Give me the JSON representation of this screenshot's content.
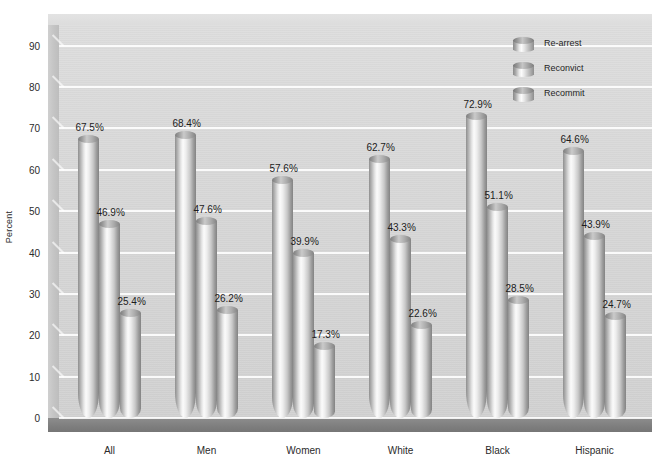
{
  "chart_data": {
    "type": "bar",
    "title": "",
    "subtitle": "",
    "xlabel": "",
    "ylabel": "Percent",
    "ylim": [
      0,
      95
    ],
    "ytick_values": [
      0,
      10,
      20,
      30,
      40,
      50,
      60,
      70,
      80,
      90
    ],
    "ytick_labels": [
      "0",
      "10",
      "20",
      "30",
      "40",
      "50",
      "60",
      "70",
      "80",
      "90"
    ],
    "grid": true,
    "grid_axis": "y",
    "legend_position": "top-right",
    "categories": [
      "All",
      "Men",
      "Women",
      "White",
      "Black",
      "Hispanic"
    ],
    "series": [
      {
        "name": "Re-arrest",
        "values": [
          67.5,
          68.4,
          57.6,
          62.7,
          72.9,
          64.6
        ],
        "labels": [
          "67.5%",
          "68.4%",
          "57.6%",
          "62.7%",
          "72.9%",
          "64.6%"
        ]
      },
      {
        "name": "Reconvict",
        "values": [
          46.9,
          47.6,
          39.9,
          43.3,
          51.1,
          43.9
        ],
        "labels": [
          "46.9%",
          "47.6%",
          "39.9%",
          "43.3%",
          "51.1%",
          "43.9%"
        ]
      },
      {
        "name": "Recommit",
        "values": [
          25.4,
          26.2,
          17.3,
          22.6,
          28.5,
          24.7
        ],
        "labels": [
          "25.4%",
          "26.2%",
          "17.3%",
          "22.6%",
          "28.5%",
          "24.7%"
        ]
      }
    ],
    "style": {
      "render": "3d-cylinder",
      "plot_background": "#d8d8d8",
      "floor_color": "#808080",
      "gridline_color": "#ffffff",
      "page_background": "#ffffff",
      "bar_highlight": "#fbfbfb",
      "bar_shadow": "#838383",
      "text_color": "#1f1f1f"
    }
  },
  "legend": {
    "items": [
      {
        "label": "Re-arrest"
      },
      {
        "label": "Reconvict"
      },
      {
        "label": "Recommit"
      }
    ]
  }
}
